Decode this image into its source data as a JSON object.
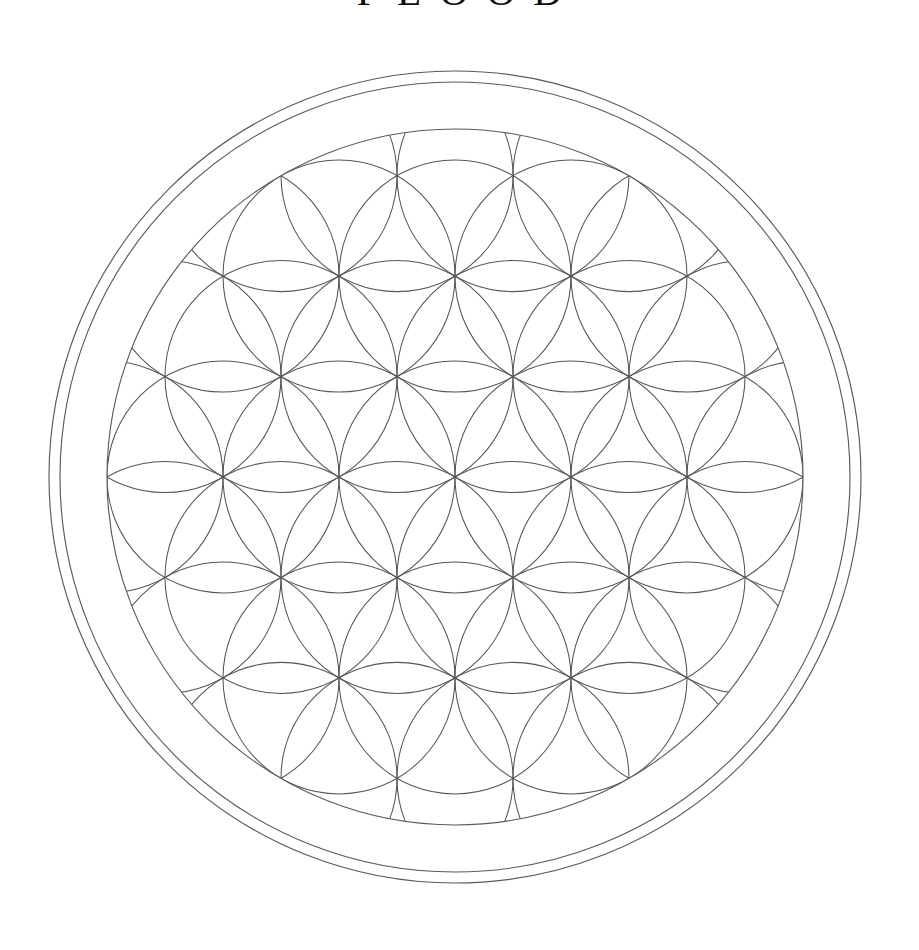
{
  "title": {
    "text": "FLOOD",
    "cropped": "true"
  },
  "figure": {
    "name": "Flower of Life",
    "background_color": "#ffffff",
    "stroke_color": "#555555",
    "ring_stroke_color": "#5a5a5a",
    "stroke_width": 1.05,
    "ring_stroke_width": 1.15,
    "center": {
      "x": 455,
      "y": 477
    },
    "outer_ring_radius": 406,
    "inner_ring_radius": 395,
    "pattern_radius": 348,
    "circle_radius": 116,
    "grid_rings": 3,
    "canvas": {
      "width": 919,
      "height": 950
    }
  }
}
